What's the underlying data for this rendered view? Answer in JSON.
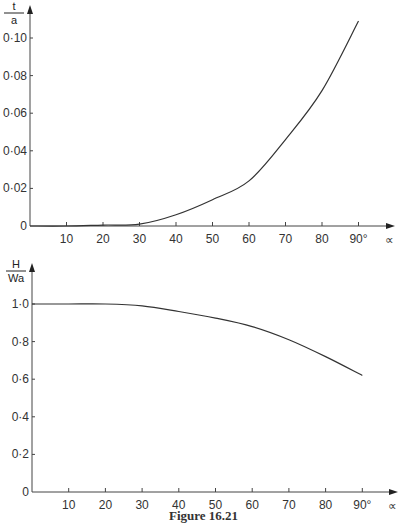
{
  "chart_data": [
    {
      "type": "line",
      "title": "",
      "ylabel_num": "t",
      "ylabel_den": "a",
      "xlabel": "∝",
      "x": [
        0,
        10,
        20,
        30,
        40,
        50,
        60,
        70,
        80,
        90
      ],
      "series": [
        {
          "name": "t/a",
          "values": [
            0,
            0,
            0.0005,
            0.001,
            0.006,
            0.014,
            0.024,
            0.046,
            0.072,
            0.109
          ]
        }
      ],
      "xticks": [
        "10",
        "20",
        "30",
        "40",
        "50",
        "60",
        "70",
        "80",
        "90°"
      ],
      "yticks": [
        "0",
        "0·02",
        "0·04",
        "0·06",
        "0·08",
        "0·10"
      ],
      "xlim": [
        0,
        90
      ],
      "ylim": [
        0,
        0.11
      ],
      "grid": false
    },
    {
      "type": "line",
      "title": "",
      "ylabel_num": "H",
      "ylabel_den": "Wa",
      "xlabel": "∝",
      "x": [
        0,
        10,
        20,
        30,
        40,
        50,
        60,
        70,
        80,
        90
      ],
      "series": [
        {
          "name": "H/Wa",
          "values": [
            1.0,
            1.0,
            1.0,
            0.99,
            0.96,
            0.925,
            0.88,
            0.81,
            0.72,
            0.62
          ]
        }
      ],
      "xticks": [
        "10",
        "20",
        "30",
        "40",
        "50",
        "60",
        "70",
        "80",
        "90°"
      ],
      "yticks": [
        "0",
        "0·2",
        "0·4",
        "0·6",
        "0·8",
        "1·0"
      ],
      "xlim": [
        0,
        90
      ],
      "ylim": [
        0,
        1.0
      ],
      "grid": false
    }
  ],
  "caption": "Figure 16.21"
}
